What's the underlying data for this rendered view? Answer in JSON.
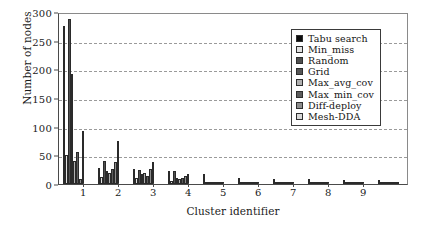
{
  "chart_data": {
    "type": "bar",
    "title": "",
    "xlabel": "Cluster identifier",
    "ylabel": "Number of nodes",
    "categories": [
      "1",
      "2",
      "3",
      "4",
      "5",
      "6",
      "7",
      "8",
      "9",
      ""
    ],
    "xtick_labels": [
      "1",
      "2",
      "3",
      "4",
      "5",
      "6",
      "7",
      "8",
      "9"
    ],
    "ytick_labels": [
      "0",
      "50",
      "100",
      "150",
      "200",
      "250",
      "300"
    ],
    "ylim": [
      0,
      300
    ],
    "ytick_step": 50,
    "grid": true,
    "grid_axis": "y",
    "grid_style": "dashed",
    "legend_position": "upper right",
    "series": [
      {
        "name": "Tabu search",
        "color": "#0d0d0d",
        "values": [
          276,
          28,
          26,
          23,
          17,
          11,
          8,
          8,
          7,
          7
        ]
      },
      {
        "name": "Min_miss",
        "color": "#e2e2e2",
        "values": [
          50,
          12,
          10,
          6,
          3,
          2,
          2,
          2,
          2,
          2
        ]
      },
      {
        "name": "Random",
        "color": "#4f4f4f",
        "values": [
          288,
          40,
          25,
          22,
          3,
          2,
          2,
          2,
          2,
          2
        ]
      },
      {
        "name": "Grid",
        "color": "#555555",
        "values": [
          192,
          22,
          18,
          11,
          3,
          2,
          2,
          2,
          2,
          2
        ]
      },
      {
        "name": "Max_avg_cov",
        "color": "#b0b0b0",
        "values": [
          40,
          20,
          20,
          8,
          3,
          2,
          2,
          2,
          2,
          2
        ]
      },
      {
        "name": "Max_min_cov",
        "color": "#5c5c5c",
        "values": [
          56,
          26,
          14,
          11,
          3,
          2,
          2,
          2,
          2,
          2
        ]
      },
      {
        "name": "Diff-deploy",
        "color": "#8c8c8c",
        "values": [
          8,
          38,
          26,
          14,
          4,
          3,
          2,
          2,
          2,
          2
        ]
      },
      {
        "name": "Mesh-DDA",
        "color": "#d8d8d8",
        "values": [
          93,
          75,
          38,
          18,
          4,
          3,
          2,
          2,
          2,
          2
        ]
      }
    ]
  },
  "legend": {
    "items": [
      {
        "label": "Tabu search"
      },
      {
        "label": "Min_miss"
      },
      {
        "label": "Random"
      },
      {
        "label": "Grid"
      },
      {
        "label": "Max_avg_cov"
      },
      {
        "label": "Max_min_cov"
      },
      {
        "label": "Diff-deploy"
      },
      {
        "label": "Mesh-DDA"
      }
    ]
  },
  "axes": {
    "y_title": "Number of nodes",
    "x_title": "Cluster identifier"
  }
}
